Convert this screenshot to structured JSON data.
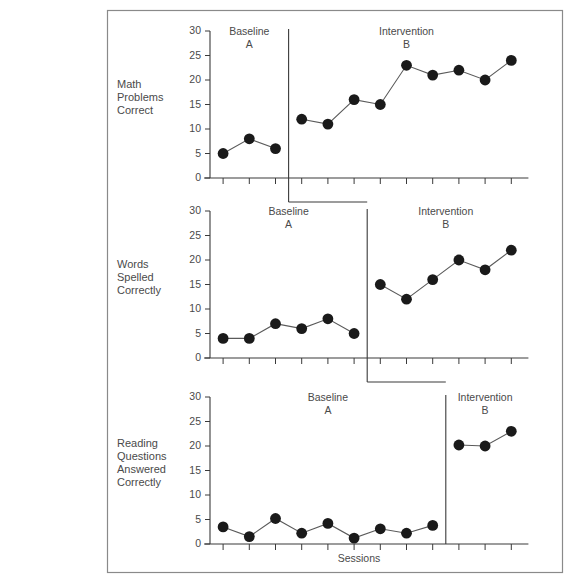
{
  "figure": {
    "x_axis_title": "Sessions",
    "y_axis_ticks": [
      "0",
      "5",
      "10",
      "15",
      "20",
      "25",
      "30"
    ],
    "phase_a_label": "Baseline",
    "phase_a_letter": "A",
    "phase_b_label": "Intervention",
    "phase_b_letter": "B",
    "marker_color": "#1a1a1a",
    "line_color": "#5a5a5a",
    "axis_color": "#3a3a3a",
    "border_color": "#8a8a8a",
    "background_color": "#ffffff"
  },
  "panels": [
    {
      "id": "math-problems-correct",
      "label_lines": [
        "Math",
        "Problems",
        "Correct"
      ],
      "phase_a_label": "Baseline",
      "phase_a_letter": "A",
      "phase_b_label": "Intervention",
      "phase_b_letter": "B",
      "baseline_sessions": 3,
      "intervention_sessions": 9,
      "baseline_values": [
        5,
        8,
        6
      ],
      "intervention_values": [
        12,
        11,
        16,
        15,
        23,
        21,
        22,
        20,
        24
      ]
    },
    {
      "id": "words-spelled-correctly",
      "label_lines": [
        "Words",
        "Spelled",
        "Correctly"
      ],
      "phase_a_label": "Baseline",
      "phase_a_letter": "A",
      "phase_b_label": "Intervention",
      "phase_b_letter": "B",
      "baseline_sessions": 6,
      "intervention_sessions": 6,
      "baseline_values": [
        4,
        4,
        7,
        6,
        8,
        5
      ],
      "intervention_values": [
        15,
        12,
        16,
        20,
        18,
        22
      ]
    },
    {
      "id": "reading-questions-answered-correctly",
      "label_lines": [
        "Reading",
        "Questions",
        "Answered",
        "Correctly"
      ],
      "phase_a_label": "Baseline",
      "phase_a_letter": "A",
      "phase_b_label": "Intervention",
      "phase_b_letter": "B",
      "baseline_sessions": 9,
      "intervention_sessions": 3,
      "baseline_values": [
        3.5,
        1.5,
        5.2,
        2.2,
        4.2,
        1.2,
        3.1,
        2.2,
        3.8
      ],
      "intervention_values": [
        20.2,
        20,
        23
      ]
    }
  ],
  "chart_data": {
    "type": "line",
    "title": "",
    "subtitle": "",
    "xlabel": "Sessions",
    "ylabel": "",
    "ylim": [
      0,
      30
    ],
    "yticks": [
      0,
      5,
      10,
      15,
      20,
      25,
      30
    ],
    "grid": false,
    "legend": "none",
    "design": "multiple-baseline across behaviors (A-B)",
    "x": [
      1,
      2,
      3,
      4,
      5,
      6,
      7,
      8,
      9,
      10,
      11,
      12
    ],
    "series": [
      {
        "name": "Math Problems Correct",
        "phase_change_after_session": 3,
        "values": [
          5,
          8,
          6,
          12,
          11,
          16,
          15,
          23,
          21,
          22,
          20,
          24
        ],
        "phase_a_values": [
          5,
          8,
          6
        ],
        "phase_b_values": [
          12,
          11,
          16,
          15,
          23,
          21,
          22,
          20,
          24
        ]
      },
      {
        "name": "Words Spelled Correctly",
        "phase_change_after_session": 6,
        "values": [
          4,
          4,
          7,
          6,
          8,
          5,
          15,
          12,
          16,
          20,
          18,
          22
        ],
        "phase_a_values": [
          4,
          4,
          7,
          6,
          8,
          5
        ],
        "phase_b_values": [
          15,
          12,
          16,
          20,
          18,
          22
        ]
      },
      {
        "name": "Reading Questions Answered Correctly",
        "phase_change_after_session": 9,
        "values": [
          3.5,
          1.5,
          5.2,
          2.2,
          4.2,
          1.2,
          3.1,
          2.2,
          3.8,
          20.2,
          20,
          23
        ],
        "phase_a_values": [
          3.5,
          1.5,
          5.2,
          2.2,
          4.2,
          1.2,
          3.1,
          2.2,
          3.8
        ],
        "phase_b_values": [
          20.2,
          20,
          23
        ]
      }
    ],
    "annotations": [
      {
        "text": "Baseline",
        "panel": 0,
        "phase": "A"
      },
      {
        "text": "A",
        "panel": 0,
        "phase": "A"
      },
      {
        "text": "Intervention",
        "panel": 0,
        "phase": "B"
      },
      {
        "text": "B",
        "panel": 0,
        "phase": "B"
      },
      {
        "text": "Baseline",
        "panel": 1,
        "phase": "A"
      },
      {
        "text": "A",
        "panel": 1,
        "phase": "A"
      },
      {
        "text": "Intervention",
        "panel": 1,
        "phase": "B"
      },
      {
        "text": "B",
        "panel": 1,
        "phase": "B"
      },
      {
        "text": "Baseline",
        "panel": 2,
        "phase": "A"
      },
      {
        "text": "A",
        "panel": 2,
        "phase": "A"
      },
      {
        "text": "Intervention",
        "panel": 2,
        "phase": "B"
      },
      {
        "text": "B",
        "panel": 2,
        "phase": "B"
      }
    ]
  }
}
